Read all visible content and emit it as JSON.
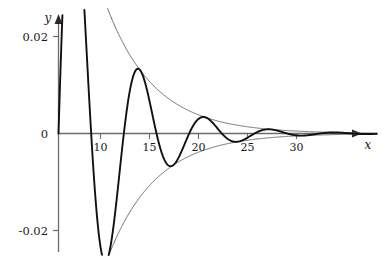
{
  "chart_data": {
    "type": "line",
    "title": "",
    "subtitle": "",
    "xlabel": "x",
    "ylabel": "y",
    "xlim": [
      0,
      32.5
    ],
    "ylim": [
      -0.026,
      0.026
    ],
    "grid": false,
    "legend": null,
    "x_ticks": [
      10,
      15,
      20,
      25,
      30
    ],
    "x_tick_labels": [
      "10",
      "15",
      "20",
      "25",
      "30"
    ],
    "y_ticks": [
      0.02,
      0,
      -0.02
    ],
    "y_tick_labels": [
      "0.02",
      "0",
      "-0.02"
    ],
    "annotations": [],
    "series": [
      {
        "name": "damped-oscillation",
        "role": "main-curve",
        "style": "solid-thick-black",
        "color": "#111111",
        "description": "damped sinusoid y = A*exp(-k*x)*sin(w*x)",
        "amplitude_A": 0.072,
        "decay_k": 0.205,
        "omega": 0.9424,
        "period": 6.667,
        "x": [
          0,
          0.5,
          1,
          1.5,
          2,
          2.5,
          3,
          3.5,
          4,
          4.5,
          5,
          5.5,
          6,
          6.5,
          7,
          7.5,
          8,
          8.5,
          9,
          9.5,
          10,
          10.5,
          11,
          11.5,
          12,
          12.5,
          13,
          13.5,
          14,
          14.5,
          15,
          15.5,
          16,
          16.5,
          17,
          17.5,
          18,
          18.5,
          19,
          19.5,
          20,
          20.5,
          21,
          21.5,
          22,
          22.5,
          23,
          23.5,
          24,
          24.5,
          25,
          25.5,
          26,
          26.5,
          27,
          27.5,
          28,
          28.5,
          29,
          29.5,
          30,
          30.5,
          31,
          31.5,
          32
        ],
        "y": [
          0.0,
          0.0029,
          0.0053,
          0.0073,
          0.0086,
          0.0094,
          0.0096,
          0.0093,
          0.0085,
          0.0073,
          0.0057,
          0.0039,
          0.0019,
          -0.0002,
          -0.0022,
          -0.0041,
          -0.0057,
          -0.007,
          -0.0079,
          -0.0084,
          -0.0085,
          -0.0082,
          -0.0075,
          -0.0065,
          -0.0053,
          -0.0039,
          -0.0024,
          -0.0009,
          0.0006,
          0.0019,
          0.0031,
          0.004,
          0.0047,
          0.0051,
          0.0052,
          0.005,
          0.0046,
          0.004,
          0.0033,
          0.0024,
          0.0015,
          0.0006,
          -0.0003,
          -0.0011,
          -0.0018,
          -0.0024,
          -0.0028,
          -0.0031,
          -0.0031,
          -0.003,
          -0.0028,
          -0.0024,
          -0.002,
          -0.0015,
          -0.0009,
          -0.0003,
          0.0002,
          0.0007,
          0.0011,
          0.0014,
          0.0017,
          0.0018,
          0.0018,
          0.0018,
          0.0017
        ]
      },
      {
        "name": "upper-envelope",
        "role": "envelope",
        "style": "thin-gray",
        "color": "#5a5a5a",
        "description": "positive envelope +A*exp(-k*x)"
      },
      {
        "name": "lower-envelope",
        "role": "envelope",
        "style": "thin-gray",
        "color": "#5a5a5a",
        "description": "negative envelope -A*exp(-k*x)"
      }
    ],
    "peaks": [
      {
        "x": 7.0,
        "y": 0.0168
      },
      {
        "x": 13.7,
        "y": 0.0052
      },
      {
        "x": 20.4,
        "y": 0.0033
      },
      {
        "x": 27.0,
        "y": 0.0019
      }
    ],
    "troughs": [
      {
        "x": 10.3,
        "y": -0.009
      },
      {
        "x": 17.0,
        "y": -0.0052
      },
      {
        "x": 23.7,
        "y": -0.0026
      },
      {
        "x": 30.4,
        "y": -0.0012
      }
    ]
  },
  "axes": {
    "x_axis_label": "x",
    "y_axis_label": "y",
    "y_top_label": "0.02",
    "y_zero_label": "0",
    "y_bottom_label": "-0.02",
    "x_tick_10": "10",
    "x_tick_15": "15",
    "x_tick_20": "20",
    "x_tick_25": "25",
    "x_tick_30": "30"
  },
  "colors": {
    "curve": "#111111",
    "envelope": "#5a5a5a",
    "axis": "#6b6b6b",
    "text": "#1a1a1a",
    "background": "#ffffff"
  }
}
